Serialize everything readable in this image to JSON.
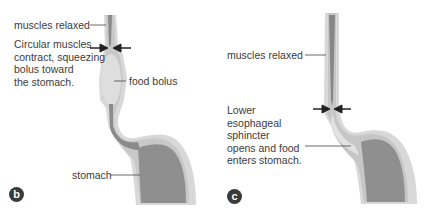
{
  "panels": [
    {
      "id": "b",
      "badge": "b",
      "labels": {
        "muscles_relaxed": "muscles relaxed",
        "circular_muscles": [
          "Circular muscles",
          "contract, squeezing",
          "bolus toward",
          "the stomach."
        ],
        "food_bolus": "food bolus",
        "stomach": "stomach"
      }
    },
    {
      "id": "c",
      "badge": "c",
      "labels": {
        "muscles_relaxed": "muscles relaxed",
        "sphincter": [
          "Lower",
          "esophageal",
          "sphincter",
          "opens and food",
          "enters stomach."
        ]
      }
    }
  ],
  "colors": {
    "outer_wall": "#d9d9d9",
    "inner_wall": "#c4c4c4",
    "lumen": "#8c8c8c",
    "stomach_interior": "#8e8e8e",
    "bolus": "#dcdcdc",
    "arrow": "#222222",
    "text": "#3c3c3c"
  }
}
